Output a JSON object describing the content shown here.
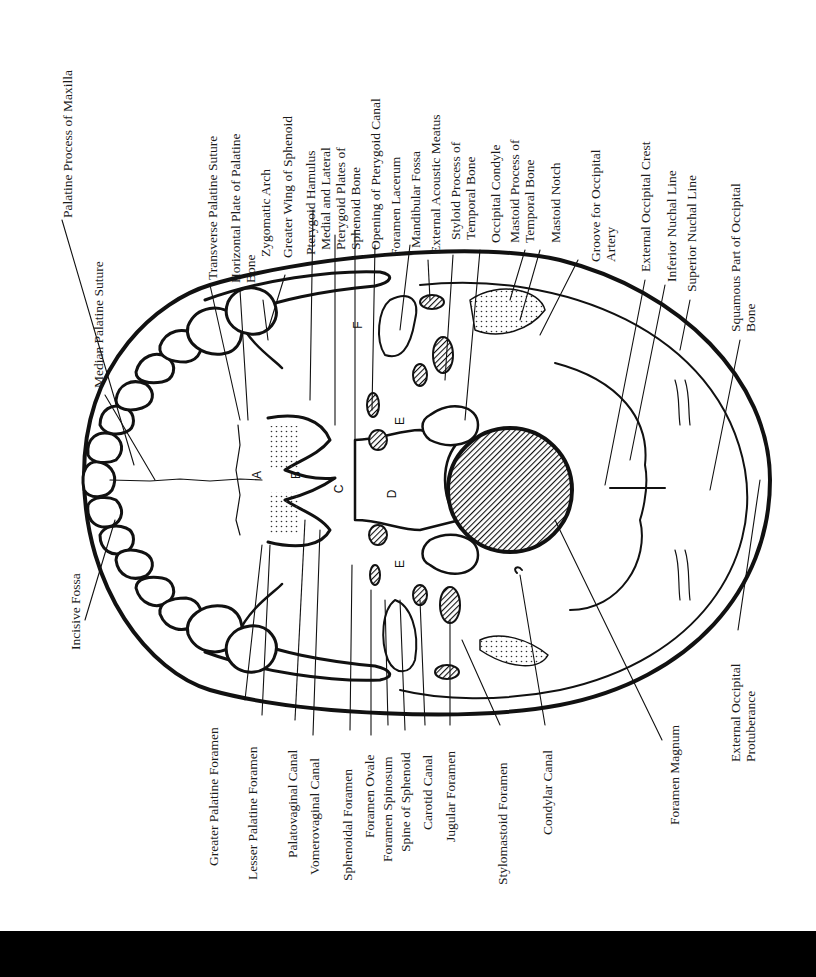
{
  "figure": {
    "orientation": "rotated 90 degrees counter-clockwise"
  },
  "labels_top": [
    {
      "id": "palatine-process-of-maxilla",
      "text": "Palatine Process of Maxilla"
    },
    {
      "id": "median-palatine-suture",
      "text": "Median Palatine Suture"
    },
    {
      "id": "transverse-palatine-suture",
      "text": "Transverse Palatine Suture"
    },
    {
      "id": "horizontal-plate-of-palatine-bone",
      "text": "Horizontal Plate of Palatine\nBone"
    },
    {
      "id": "zygomatic-arch",
      "text": "Zygomatic Arch"
    },
    {
      "id": "greater-wing-of-sphenoid",
      "text": "Greater Wing of Sphenoid"
    },
    {
      "id": "pterygoid-hamulus",
      "text": "Pterygoid Hamulus"
    },
    {
      "id": "medial-lateral-pterygoid-plates",
      "text": "Medial and Lateral\nPterygoid Plates of\nSphenoid Bone"
    },
    {
      "id": "opening-of-pterygoid-canal",
      "text": "Opening of Pterygoid Canal"
    },
    {
      "id": "foramen-lacerum",
      "text": "Foramen Lacerum"
    },
    {
      "id": "mandibular-fossa",
      "text": "Mandibular Fossa"
    },
    {
      "id": "external-acoustic-meatus",
      "text": "External Acoustic Meatus"
    },
    {
      "id": "styloid-process-of-temporal-bone",
      "text": "Styloid Process of\nTemporal Bone"
    },
    {
      "id": "occipital-condyle",
      "text": "Occipital Condyle"
    },
    {
      "id": "mastoid-process-of-temporal-bone",
      "text": "Mastoid Process of\nTemporal Bone"
    },
    {
      "id": "mastoid-notch",
      "text": "Mastoid Notch"
    },
    {
      "id": "groove-for-occipital-artery",
      "text": "Groove for Occipital\nArtery"
    },
    {
      "id": "external-occipital-crest",
      "text": "External Occipital Crest"
    },
    {
      "id": "inferior-nuchal-line",
      "text": "Inferior Nuchal Line"
    },
    {
      "id": "superior-nuchal-line",
      "text": "Superior Nuchal Line"
    },
    {
      "id": "squamous-part-of-occipital-bone",
      "text": "Squamous Part of Occipital\nBone"
    }
  ],
  "labels_bottom": [
    {
      "id": "incisive-fossa",
      "text": "Incisive Fossa"
    },
    {
      "id": "greater-palatine-foramen",
      "text": "Greater Palatine Foramen"
    },
    {
      "id": "lesser-palatine-foramen",
      "text": "Lesser Palatine Foramen"
    },
    {
      "id": "palatovaginal-canal",
      "text": "Palatovaginal Canal"
    },
    {
      "id": "vomerovaginal-canal",
      "text": "Vomerovaginal Canal"
    },
    {
      "id": "sphenoidal-foramen",
      "text": "Sphenoidal Foramen"
    },
    {
      "id": "foramen-ovale",
      "text": "Foramen Ovale"
    },
    {
      "id": "foramen-spinosum",
      "text": "Foramen Spinosum"
    },
    {
      "id": "spine-of-sphenoid",
      "text": "Spine of Sphenoid"
    },
    {
      "id": "carotid-canal",
      "text": "Carotid Canal"
    },
    {
      "id": "jugular-foramen",
      "text": "Jugular Foramen"
    },
    {
      "id": "stylomastoid-foramen",
      "text": "Stylomastoid Foramen"
    },
    {
      "id": "condylar-canal",
      "text": "Condylar Canal"
    },
    {
      "id": "foramen-magnum",
      "text": "Foramen Magnum"
    },
    {
      "id": "external-occipital-protuberance",
      "text": "External Occipital\nProtuberance"
    }
  ],
  "region_markers": [
    {
      "id": "A",
      "text": "A"
    },
    {
      "id": "B",
      "text": "B"
    },
    {
      "id": "C",
      "text": "C"
    },
    {
      "id": "D",
      "text": "D"
    },
    {
      "id": "E1",
      "text": "E"
    },
    {
      "id": "E2",
      "text": "E"
    },
    {
      "id": "F",
      "text": "F"
    }
  ],
  "colors": {
    "ink": "#1a1a1a",
    "background": "#ffffff",
    "bottom_bar": "#000000"
  }
}
